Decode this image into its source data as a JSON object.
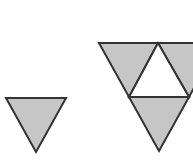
{
  "diagram": {
    "title": "",
    "colors": {
      "fill": "#c6c6c6",
      "stroke": "#333333",
      "background": "#ffffff",
      "hole": "#ffffff"
    },
    "stages": [
      {
        "name": "stage-0",
        "shape": "single inverted triangle"
      },
      {
        "name": "stage-1",
        "shape": "inverted triangle subdivided into 3 shaded + 1 unshaded center"
      }
    ]
  }
}
